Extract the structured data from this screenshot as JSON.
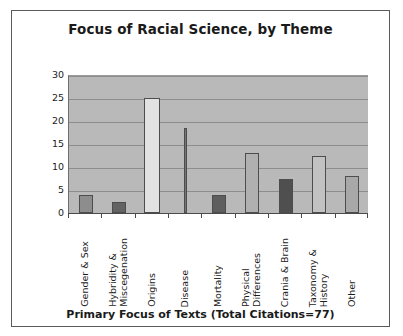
{
  "chart_data": {
    "type": "bar",
    "title": "Focus of Racial Science, by Theme",
    "xlabel": "Primary Focus of Texts (Total Citations=77)",
    "ylabel": "",
    "ylim": [
      0,
      30
    ],
    "ytick_labels": [
      "30",
      "25",
      "20",
      "15",
      "10",
      "5",
      "0"
    ],
    "yticks": [
      30,
      25,
      20,
      15,
      10,
      5,
      0
    ],
    "grid": true,
    "legend": "none",
    "categories": [
      "Gender & Sex",
      "Hybridity &\nMiscegenation",
      "Origins",
      "Disease",
      "Mortality",
      "Physical\nDifferences",
      "Crania & Brain",
      "Taxonomy &\nHistory",
      "Other"
    ],
    "values": [
      4,
      2.5,
      25,
      18.5,
      4,
      13,
      7.5,
      12.5,
      8
    ],
    "bar_colors": [
      "#8d8d8d",
      "#636363",
      "#e2e2e2",
      "#757575",
      "#5e5e5e",
      "#b0b0b0",
      "#4f4f4f",
      "#c2c2c2",
      "#a8a8a8"
    ],
    "bar_widths": [
      14,
      14,
      16,
      3,
      14,
      14,
      14,
      14,
      14
    ],
    "plot_background": "#b9b9b9",
    "gridline_color": "#8d8d8d",
    "axis_color": "#4a4a4a",
    "frame_color": "#5b5b5b",
    "text_color": "#1c1c1c"
  }
}
